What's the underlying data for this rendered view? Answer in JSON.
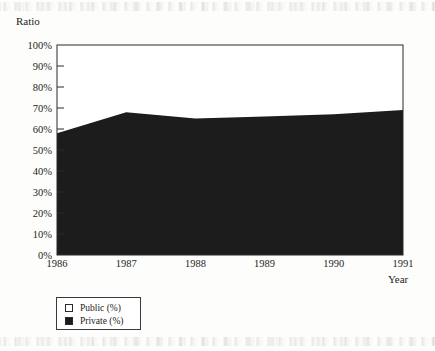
{
  "chart_data": {
    "type": "area",
    "title": "",
    "subtitle": "",
    "xlabel": "Year",
    "ylabel": "Ratio",
    "stacked": true,
    "stack_total": 100,
    "grid": false,
    "legend_position": "bottom-left",
    "categories": [
      "1986",
      "1987",
      "1988",
      "1989",
      "1990",
      "1991"
    ],
    "x": [
      1986,
      1987,
      1988,
      1989,
      1990,
      1991
    ],
    "xlim": [
      1986,
      1991
    ],
    "ylim": [
      0,
      100
    ],
    "ytick_values": [
      0,
      10,
      20,
      30,
      40,
      50,
      60,
      70,
      80,
      90,
      100
    ],
    "ytick_labels": [
      "0%",
      "10%",
      "20%",
      "30%",
      "40%",
      "50%",
      "60%",
      "70%",
      "80%",
      "90%",
      "100%"
    ],
    "xtick_labels": [
      "1986",
      "1987",
      "1988",
      "1989",
      "1990",
      "1991"
    ],
    "series": [
      {
        "name": "Private (%)",
        "color": "#1c1c1c",
        "values": [
          58,
          68,
          65,
          66,
          67,
          69
        ]
      },
      {
        "name": "Public (%)",
        "color": "#ffffff",
        "values": [
          42,
          32,
          35,
          34,
          33,
          31
        ]
      }
    ]
  },
  "axes": {
    "y_title": "Ratio",
    "x_title": "Year"
  },
  "legend": {
    "items": [
      {
        "label": "Public (%)",
        "swatch": "white-square-icon"
      },
      {
        "label": "Private (%)",
        "swatch": "black-square-icon"
      }
    ]
  }
}
